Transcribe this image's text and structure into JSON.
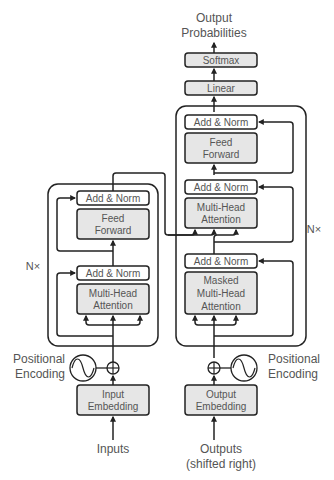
{
  "colors": {
    "stroke": "#222222",
    "box_fill_gray": "#e6e6e6",
    "box_fill_white": "#ffffff",
    "text": "#555555"
  },
  "decoder": {
    "output_label_line1": "Output",
    "output_label_line2": "Probabilities",
    "softmax": "Softmax",
    "linear": "Linear",
    "add_norm_top": "Add & Norm",
    "feed_forward_line1": "Feed",
    "feed_forward_line2": "Forward",
    "add_norm_mid": "Add & Norm",
    "mha_line1": "Multi-Head",
    "mha_line2": "Attention",
    "add_norm_bottom": "Add & Norm",
    "masked_line1": "Masked",
    "masked_line2": "Multi-Head",
    "masked_line3": "Attention",
    "repeat_label": "N×",
    "positional_line1": "Positional",
    "positional_line2": "Encoding",
    "embedding_line1": "Output",
    "embedding_line2": "Embedding",
    "input_label_line1": "Outputs",
    "input_label_line2": "(shifted right)"
  },
  "encoder": {
    "add_norm_top": "Add & Norm",
    "feed_forward_line1": "Feed",
    "feed_forward_line2": "Forward",
    "add_norm_bottom": "Add & Norm",
    "mha_line1": "Multi-Head",
    "mha_line2": "Attention",
    "repeat_label": "N×",
    "positional_line1": "Positional",
    "positional_line2": "Encoding",
    "embedding_line1": "Input",
    "embedding_line2": "Embedding",
    "input_label": "Inputs"
  }
}
